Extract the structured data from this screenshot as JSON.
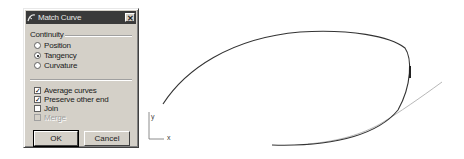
{
  "dialog": {
    "title": "Match Curve",
    "close_label": "✕",
    "continuity": {
      "label": "Continuity",
      "options": [
        {
          "label": "Position",
          "selected": false
        },
        {
          "label": "Tangency",
          "selected": true
        },
        {
          "label": "Curvature",
          "selected": false
        }
      ]
    },
    "checkboxes": [
      {
        "label": "Average curves",
        "checked": true,
        "enabled": true
      },
      {
        "label": "Preserve other end",
        "checked": true,
        "enabled": true
      },
      {
        "label": "Join",
        "checked": false,
        "enabled": true
      },
      {
        "label": "Merge",
        "checked": false,
        "enabled": false
      }
    ],
    "ok_label": "OK",
    "cancel_label": "Cancel"
  },
  "viewport": {
    "axis": {
      "x_label": "x",
      "y_label": "y"
    },
    "colors": {
      "main_curve": "#333333",
      "secondary_curve": "#b0b0b0"
    }
  }
}
